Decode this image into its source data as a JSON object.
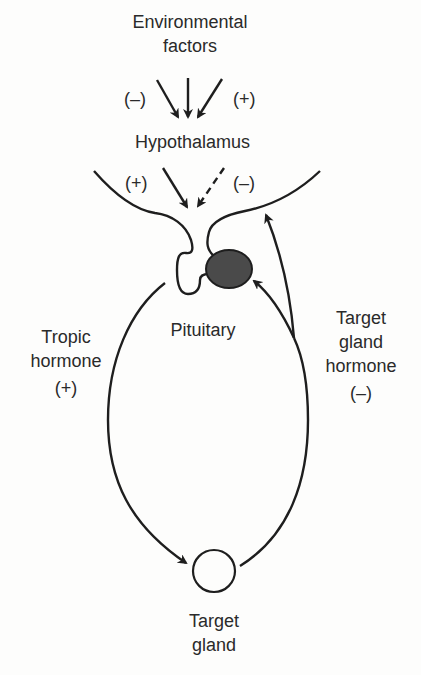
{
  "diagram": {
    "type": "feedback-loop",
    "nodes": {
      "environmental_factors": {
        "line1": "Environmental",
        "line2": "factors"
      },
      "hypothalamus": {
        "label": "Hypothalamus"
      },
      "pituitary": {
        "label": "Pituitary"
      },
      "target_gland": {
        "line1": "Target",
        "line2": "gland"
      }
    },
    "edges": {
      "env_to_hypothalamus": {
        "left_sign": "(–)",
        "right_sign": "(+)"
      },
      "hypothalamus_to_pituitary": {
        "left_sign": "(+)",
        "right_sign": "(–)"
      },
      "tropic_hormone": {
        "line1": "Tropic",
        "line2": "hormone",
        "sign": "(+)"
      },
      "target_gland_hormone": {
        "line1": "Target",
        "line2": "gland",
        "line3": "hormone",
        "sign": "(–)"
      }
    },
    "colors": {
      "ink": "#1e1e1e",
      "pituitary_fill": "#4a4a4a",
      "background": "#fdfdfc"
    }
  }
}
